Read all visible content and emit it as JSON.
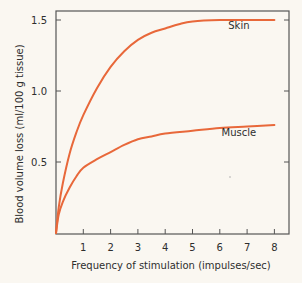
{
  "chart_data": {
    "type": "line",
    "title": "",
    "xlabel": "Frequency of stimulation (impulses/sec)",
    "ylabel": "Blood volume loss (ml/100 g tissue)",
    "xlim": [
      0,
      8.5
    ],
    "ylim": [
      0,
      1.6
    ],
    "xticks": [
      1,
      2,
      3,
      4,
      5,
      6,
      7,
      8
    ],
    "yticks": [
      0.5,
      1.0,
      1.5
    ],
    "ytick_labels": [
      "0.5",
      "1.0",
      "1.5"
    ],
    "grid": false,
    "legend": "inline labels",
    "line_color": "#e8683a",
    "series": [
      {
        "name": "Skin",
        "x": [
          0,
          0.1,
          0.25,
          0.5,
          0.75,
          1,
          1.5,
          2,
          2.5,
          3,
          3.5,
          4,
          4.5,
          5,
          6,
          7,
          8
        ],
        "values": [
          0,
          0.18,
          0.35,
          0.56,
          0.71,
          0.83,
          1.02,
          1.17,
          1.28,
          1.36,
          1.41,
          1.44,
          1.47,
          1.49,
          1.5,
          1.5,
          1.5
        ],
        "label_pos": {
          "x": 6.7,
          "y": 1.44
        }
      },
      {
        "name": "Muscle",
        "x": [
          0,
          0.1,
          0.25,
          0.5,
          0.75,
          1,
          1.5,
          2,
          2.5,
          3,
          3.5,
          4,
          5,
          6,
          7,
          8
        ],
        "values": [
          0,
          0.13,
          0.22,
          0.32,
          0.4,
          0.46,
          0.52,
          0.57,
          0.62,
          0.66,
          0.68,
          0.7,
          0.72,
          0.74,
          0.75,
          0.76
        ],
        "label_pos": {
          "x": 6.7,
          "y": 0.68
        }
      }
    ]
  }
}
